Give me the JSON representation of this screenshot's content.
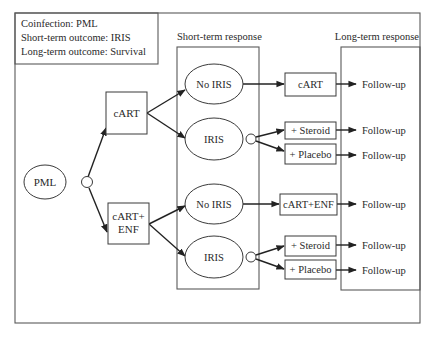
{
  "info_box": {
    "lines": [
      "Coinfection: PML",
      "Short-term outcome: IRIS",
      "Long-term outcome: Survival"
    ]
  },
  "sections": {
    "short_term_label": "Short-term response",
    "long_term_label": "Long-term response"
  },
  "root": {
    "label": "PML"
  },
  "treatments": [
    {
      "id": "cart",
      "label_lines": [
        "cART"
      ]
    },
    {
      "id": "cart-enf",
      "label_lines": [
        "cART+",
        "ENF"
      ]
    }
  ],
  "short_term_nodes": [
    {
      "label": "No IRIS"
    },
    {
      "label": "IRIS"
    },
    {
      "label": "No IRIS"
    },
    {
      "label": "IRIS"
    }
  ],
  "secondary_treatments": [
    {
      "label": "cART"
    },
    {
      "label": "+ Steroid"
    },
    {
      "label": "+ Placebo"
    },
    {
      "label": "cART+ENF"
    },
    {
      "label": "+ Steroid"
    },
    {
      "label": "+ Placebo"
    }
  ],
  "outcomes": [
    {
      "label": "Follow-up"
    },
    {
      "label": "Follow-up"
    },
    {
      "label": "Follow-up"
    },
    {
      "label": "Follow-up"
    },
    {
      "label": "Follow-up"
    },
    {
      "label": "Follow-up"
    }
  ]
}
